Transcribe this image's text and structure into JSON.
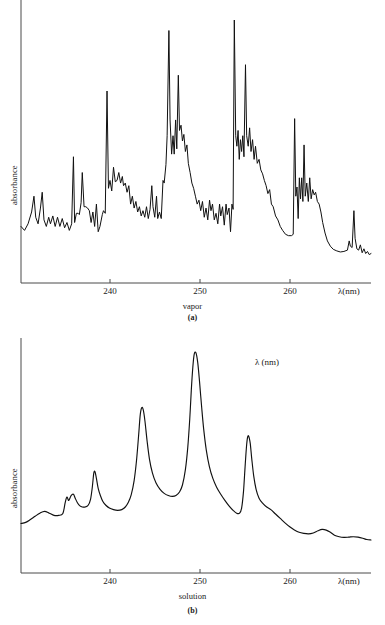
{
  "document": {
    "title": "UV absorption spectra of benzene: vapor and solution"
  },
  "style": {
    "axis_color": "#4a4a4a",
    "curve_color": "#111111",
    "background": "#ffffff",
    "text_color": "#1a1a1a"
  },
  "panels": [
    {
      "id": "a",
      "caption": "(a)",
      "subcaption": "vapor",
      "ylabel": "absorbance",
      "xlabel": "λ(nm)",
      "annotation": "",
      "ticks": [
        {
          "value": 240,
          "label": "240",
          "x_px": 110
        },
        {
          "value": 250,
          "label": "250",
          "x_px": 200
        },
        {
          "value": 260,
          "label": "260",
          "x_px": 290
        }
      ],
      "geometry": {
        "x_axis_left": 21,
        "x_axis_right": 371,
        "baseline_y": 283,
        "y_axis_top": 0,
        "lambda_at_x21": 237.0,
        "lambda_at_x371": 266.7
      }
    },
    {
      "id": "b",
      "caption": "(b)",
      "subcaption": "solution",
      "ylabel": "absorbance",
      "xlabel": "λ(nm)",
      "annotation": "λ (nm)",
      "ticks": [
        {
          "value": 240,
          "label": "240",
          "x_px": 110
        },
        {
          "value": 250,
          "label": "250",
          "x_px": 200
        },
        {
          "value": 260,
          "label": "260",
          "x_px": 290
        }
      ],
      "geometry": {
        "x_axis_left": 21,
        "x_axis_right": 371,
        "baseline_y": 255,
        "y_axis_top": 20,
        "lambda_at_x21": 237.0,
        "lambda_at_x371": 266.7
      }
    }
  ],
  "chart_data": [
    {
      "type": "line",
      "id": "vapor-spectrum",
      "title": "",
      "subtitle": "vapor",
      "xlabel": "λ(nm)",
      "ylabel": "absorbance",
      "xlim": [
        237.0,
        266.7
      ],
      "ylim": [
        0,
        1
      ],
      "xticks": [
        240,
        250,
        260
      ],
      "grid": false,
      "legend": "none",
      "note": "Highly structured vibronic band system of benzene vapour; y values are normalised absorbance (0 = baseline axis, 1 = tallest peak).",
      "points": [
        [
          237.0,
          0.215
        ],
        [
          237.3,
          0.2
        ],
        [
          237.6,
          0.225
        ],
        [
          237.9,
          0.27
        ],
        [
          238.1,
          0.33
        ],
        [
          238.25,
          0.25
        ],
        [
          238.45,
          0.225
        ],
        [
          238.65,
          0.285
        ],
        [
          238.8,
          0.345
        ],
        [
          238.95,
          0.24
        ],
        [
          239.15,
          0.215
        ],
        [
          239.35,
          0.25
        ],
        [
          239.5,
          0.225
        ],
        [
          239.7,
          0.255
        ],
        [
          239.9,
          0.215
        ],
        [
          240.1,
          0.25
        ],
        [
          240.3,
          0.215
        ],
        [
          240.5,
          0.245
        ],
        [
          240.7,
          0.21
        ],
        [
          240.9,
          0.23
        ],
        [
          241.1,
          0.2
        ],
        [
          241.3,
          0.225
        ],
        [
          241.45,
          0.48
        ],
        [
          241.55,
          0.23
        ],
        [
          241.7,
          0.265
        ],
        [
          241.85,
          0.265
        ],
        [
          241.95,
          0.26
        ],
        [
          242.1,
          0.305
        ],
        [
          242.2,
          0.42
        ],
        [
          242.35,
          0.29
        ],
        [
          242.5,
          0.29
        ],
        [
          242.65,
          0.285
        ],
        [
          242.8,
          0.275
        ],
        [
          242.95,
          0.23
        ],
        [
          243.1,
          0.27
        ],
        [
          243.25,
          0.215
        ],
        [
          243.4,
          0.3
        ],
        [
          243.55,
          0.195
        ],
        [
          243.7,
          0.215
        ],
        [
          243.9,
          0.26
        ],
        [
          244.0,
          0.275
        ],
        [
          244.15,
          0.265
        ],
        [
          244.3,
          0.73
        ],
        [
          244.42,
          0.36
        ],
        [
          244.55,
          0.39
        ],
        [
          244.7,
          0.35
        ],
        [
          244.85,
          0.44
        ],
        [
          245.0,
          0.385
        ],
        [
          245.15,
          0.39
        ],
        [
          245.3,
          0.42
        ],
        [
          245.45,
          0.38
        ],
        [
          245.6,
          0.405
        ],
        [
          245.7,
          0.37
        ],
        [
          245.85,
          0.38
        ],
        [
          246.0,
          0.345
        ],
        [
          246.15,
          0.37
        ],
        [
          246.3,
          0.3
        ],
        [
          246.45,
          0.33
        ],
        [
          246.6,
          0.285
        ],
        [
          246.75,
          0.31
        ],
        [
          246.9,
          0.27
        ],
        [
          247.05,
          0.29
        ],
        [
          247.2,
          0.255
        ],
        [
          247.35,
          0.275
        ],
        [
          247.5,
          0.25
        ],
        [
          247.65,
          0.29
        ],
        [
          247.8,
          0.245
        ],
        [
          247.95,
          0.28
        ],
        [
          248.1,
          0.37
        ],
        [
          248.2,
          0.29
        ],
        [
          248.35,
          0.25
        ],
        [
          248.5,
          0.33
        ],
        [
          248.6,
          0.245
        ],
        [
          248.75,
          0.27
        ],
        [
          248.9,
          0.245
        ],
        [
          249.05,
          0.39
        ],
        [
          249.15,
          0.38
        ],
        [
          249.3,
          0.45
        ],
        [
          249.4,
          0.56
        ],
        [
          249.55,
          0.96
        ],
        [
          249.65,
          0.62
        ],
        [
          249.78,
          0.49
        ],
        [
          249.9,
          0.56
        ],
        [
          250.0,
          0.49
        ],
        [
          250.12,
          0.62
        ],
        [
          250.22,
          0.51
        ],
        [
          250.35,
          0.79
        ],
        [
          250.45,
          0.58
        ],
        [
          250.58,
          0.6
        ],
        [
          250.7,
          0.54
        ],
        [
          250.82,
          0.565
        ],
        [
          250.95,
          0.5
        ],
        [
          251.08,
          0.525
        ],
        [
          251.2,
          0.455
        ],
        [
          251.35,
          0.42
        ],
        [
          251.5,
          0.38
        ],
        [
          251.65,
          0.36
        ],
        [
          251.8,
          0.33
        ],
        [
          251.95,
          0.3
        ],
        [
          252.1,
          0.315
        ],
        [
          252.25,
          0.275
        ],
        [
          252.4,
          0.31
        ],
        [
          252.55,
          0.25
        ],
        [
          252.7,
          0.285
        ],
        [
          252.85,
          0.24
        ],
        [
          253.0,
          0.315
        ],
        [
          253.12,
          0.275
        ],
        [
          253.25,
          0.3
        ],
        [
          253.4,
          0.24
        ],
        [
          253.55,
          0.265
        ],
        [
          253.7,
          0.225
        ],
        [
          253.85,
          0.3
        ],
        [
          253.95,
          0.255
        ],
        [
          254.1,
          0.29
        ],
        [
          254.25,
          0.22
        ],
        [
          254.4,
          0.3
        ],
        [
          254.5,
          0.26
        ],
        [
          254.65,
          0.285
        ],
        [
          254.78,
          0.195
        ],
        [
          254.9,
          0.3
        ],
        [
          255.0,
          0.28
        ],
        [
          255.1,
          1.0
        ],
        [
          255.22,
          0.56
        ],
        [
          255.32,
          0.52
        ],
        [
          255.42,
          0.58
        ],
        [
          255.52,
          0.47
        ],
        [
          255.62,
          0.545
        ],
        [
          255.72,
          0.5
        ],
        [
          255.82,
          0.56
        ],
        [
          255.92,
          0.48
        ],
        [
          256.05,
          0.83
        ],
        [
          256.15,
          0.56
        ],
        [
          256.28,
          0.52
        ],
        [
          256.4,
          0.59
        ],
        [
          256.52,
          0.5
        ],
        [
          256.65,
          0.545
        ],
        [
          256.78,
          0.47
        ],
        [
          256.9,
          0.52
        ],
        [
          257.05,
          0.455
        ],
        [
          257.2,
          0.47
        ],
        [
          257.35,
          0.43
        ],
        [
          257.5,
          0.415
        ],
        [
          257.65,
          0.39
        ],
        [
          257.8,
          0.37
        ],
        [
          257.95,
          0.34
        ],
        [
          258.1,
          0.355
        ],
        [
          258.25,
          0.3
        ],
        [
          258.4,
          0.29
        ],
        [
          258.6,
          0.255
        ],
        [
          258.8,
          0.24
        ],
        [
          259.0,
          0.215
        ],
        [
          259.2,
          0.2
        ],
        [
          259.45,
          0.185
        ],
        [
          259.7,
          0.18
        ],
        [
          259.95,
          0.18
        ],
        [
          260.1,
          0.185
        ],
        [
          260.22,
          0.625
        ],
        [
          260.32,
          0.33
        ],
        [
          260.42,
          0.365
        ],
        [
          260.52,
          0.245
        ],
        [
          260.62,
          0.4
        ],
        [
          260.72,
          0.32
        ],
        [
          260.82,
          0.4
        ],
        [
          260.92,
          0.31
        ],
        [
          261.02,
          0.525
        ],
        [
          261.12,
          0.33
        ],
        [
          261.25,
          0.38
        ],
        [
          261.38,
          0.31
        ],
        [
          261.5,
          0.4
        ],
        [
          261.62,
          0.32
        ],
        [
          261.75,
          0.355
        ],
        [
          261.88,
          0.335
        ],
        [
          262.0,
          0.345
        ],
        [
          262.15,
          0.31
        ],
        [
          262.3,
          0.3
        ],
        [
          262.45,
          0.27
        ],
        [
          262.6,
          0.23
        ],
        [
          262.8,
          0.19
        ],
        [
          263.0,
          0.16
        ],
        [
          263.25,
          0.14
        ],
        [
          263.5,
          0.128
        ],
        [
          263.8,
          0.122
        ],
        [
          264.1,
          0.118
        ],
        [
          264.4,
          0.12
        ],
        [
          264.7,
          0.125
        ],
        [
          264.85,
          0.16
        ],
        [
          264.95,
          0.14
        ],
        [
          265.1,
          0.135
        ],
        [
          265.25,
          0.275
        ],
        [
          265.35,
          0.17
        ],
        [
          265.5,
          0.13
        ],
        [
          265.65,
          0.125
        ],
        [
          265.8,
          0.145
        ],
        [
          265.95,
          0.115
        ],
        [
          266.1,
          0.13
        ],
        [
          266.25,
          0.112
        ],
        [
          266.4,
          0.12
        ],
        [
          266.55,
          0.108
        ],
        [
          266.7,
          0.112
        ]
      ]
    },
    {
      "type": "line",
      "id": "solution-spectrum",
      "title": "",
      "subtitle": "solution",
      "xlabel": "λ(nm)",
      "ylabel": "absorbance",
      "xlim": [
        237.0,
        266.7
      ],
      "ylim": [
        0,
        1
      ],
      "xticks": [
        240,
        250,
        260
      ],
      "grid": false,
      "legend": "none",
      "annotation": "λ (nm)",
      "note": "Smoothed, vibrationally broadened benzene band in solution; four main maxima near 242.3, 248.5, 253.5 and 260.2 nm.",
      "peaks": [
        {
          "lambda": 242.3,
          "height": 0.46
        },
        {
          "lambda": 248.5,
          "height": 0.75
        },
        {
          "lambda": 253.5,
          "height": 1.0
        },
        {
          "lambda": 260.2,
          "height": 0.62
        }
      ],
      "points": [
        [
          237.0,
          0.225
        ],
        [
          237.4,
          0.23
        ],
        [
          237.8,
          0.243
        ],
        [
          238.2,
          0.258
        ],
        [
          238.6,
          0.272
        ],
        [
          239.0,
          0.28
        ],
        [
          239.4,
          0.272
        ],
        [
          239.8,
          0.262
        ],
        [
          240.2,
          0.262
        ],
        [
          240.55,
          0.27
        ],
        [
          240.75,
          0.32
        ],
        [
          240.9,
          0.345
        ],
        [
          241.05,
          0.33
        ],
        [
          241.25,
          0.352
        ],
        [
          241.45,
          0.358
        ],
        [
          241.6,
          0.34
        ],
        [
          241.8,
          0.318
        ],
        [
          242.0,
          0.305
        ],
        [
          242.2,
          0.3
        ],
        [
          242.45,
          0.3
        ],
        [
          242.7,
          0.308
        ],
        [
          242.9,
          0.335
        ],
        [
          243.05,
          0.39
        ],
        [
          243.18,
          0.455
        ],
        [
          243.28,
          0.46
        ],
        [
          243.4,
          0.43
        ],
        [
          243.55,
          0.385
        ],
        [
          243.75,
          0.35
        ],
        [
          243.95,
          0.325
        ],
        [
          244.2,
          0.308
        ],
        [
          244.5,
          0.295
        ],
        [
          244.85,
          0.288
        ],
        [
          245.2,
          0.285
        ],
        [
          245.55,
          0.288
        ],
        [
          245.85,
          0.3
        ],
        [
          246.1,
          0.32
        ],
        [
          246.35,
          0.355
        ],
        [
          246.6,
          0.42
        ],
        [
          246.8,
          0.51
        ],
        [
          246.98,
          0.625
        ],
        [
          247.12,
          0.72
        ],
        [
          247.25,
          0.752
        ],
        [
          247.38,
          0.74
        ],
        [
          247.52,
          0.69
        ],
        [
          247.7,
          0.6
        ],
        [
          247.9,
          0.518
        ],
        [
          248.15,
          0.455
        ],
        [
          248.45,
          0.41
        ],
        [
          248.8,
          0.38
        ],
        [
          249.15,
          0.362
        ],
        [
          249.5,
          0.352
        ],
        [
          249.85,
          0.348
        ],
        [
          250.15,
          0.352
        ],
        [
          250.45,
          0.368
        ],
        [
          250.7,
          0.4
        ],
        [
          250.95,
          0.47
        ],
        [
          251.15,
          0.57
        ],
        [
          251.32,
          0.7
        ],
        [
          251.45,
          0.83
        ],
        [
          251.58,
          0.935
        ],
        [
          251.7,
          0.995
        ],
        [
          251.85,
          1.0
        ],
        [
          252.0,
          0.955
        ],
        [
          252.15,
          0.87
        ],
        [
          252.32,
          0.76
        ],
        [
          252.5,
          0.655
        ],
        [
          252.72,
          0.56
        ],
        [
          252.98,
          0.485
        ],
        [
          253.28,
          0.43
        ],
        [
          253.6,
          0.39
        ],
        [
          253.95,
          0.358
        ],
        [
          254.3,
          0.33
        ],
        [
          254.65,
          0.305
        ],
        [
          255.0,
          0.285
        ],
        [
          255.3,
          0.272
        ],
        [
          255.55,
          0.272
        ],
        [
          255.72,
          0.295
        ],
        [
          255.88,
          0.37
        ],
        [
          256.0,
          0.47
        ],
        [
          256.12,
          0.565
        ],
        [
          256.22,
          0.615
        ],
        [
          256.32,
          0.622
        ],
        [
          256.45,
          0.59
        ],
        [
          256.58,
          0.52
        ],
        [
          256.75,
          0.44
        ],
        [
          256.95,
          0.38
        ],
        [
          257.2,
          0.34
        ],
        [
          257.5,
          0.318
        ],
        [
          257.85,
          0.3
        ],
        [
          258.2,
          0.288
        ],
        [
          258.6,
          0.268
        ],
        [
          259.0,
          0.248
        ],
        [
          259.4,
          0.228
        ],
        [
          259.8,
          0.21
        ],
        [
          260.2,
          0.196
        ],
        [
          260.6,
          0.185
        ],
        [
          261.0,
          0.18
        ],
        [
          261.4,
          0.178
        ],
        [
          261.8,
          0.182
        ],
        [
          262.2,
          0.192
        ],
        [
          262.55,
          0.198
        ],
        [
          262.9,
          0.195
        ],
        [
          263.25,
          0.185
        ],
        [
          263.6,
          0.172
        ],
        [
          264.0,
          0.165
        ],
        [
          264.4,
          0.162
        ],
        [
          264.8,
          0.163
        ],
        [
          265.2,
          0.165
        ],
        [
          265.6,
          0.163
        ],
        [
          266.0,
          0.158
        ],
        [
          266.35,
          0.152
        ],
        [
          266.7,
          0.15
        ]
      ]
    }
  ]
}
